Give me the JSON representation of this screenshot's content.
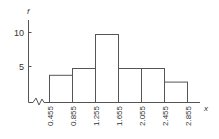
{
  "chart_data": {
    "type": "bar",
    "subtype": "histogram",
    "title": "",
    "xlabel": "x",
    "ylabel": "f",
    "bin_edges": [
      0.455,
      0.855,
      1.255,
      1.655,
      2.055,
      2.455,
      2.855
    ],
    "categories": [
      "0.455-0.855",
      "0.855-1.255",
      "1.255-1.655",
      "1.655-2.055",
      "2.055-2.455",
      "2.455-2.855"
    ],
    "values": [
      4,
      5,
      10,
      5,
      5,
      3
    ],
    "x_tick_labels": [
      "0.455",
      "0.855",
      "1.255",
      "1.655",
      "2.055",
      "2.455",
      "2.855"
    ],
    "y_ticks": [
      5,
      10
    ],
    "y_tick_labels": [
      "5",
      "10"
    ],
    "ylim": [
      0,
      12
    ],
    "grid": false,
    "legend": null,
    "axis_break": "x-axis break (zigzag) between origin and 0.455",
    "colors": {
      "line": "#555555",
      "text": "#333333",
      "fill": "#ffffff"
    }
  }
}
